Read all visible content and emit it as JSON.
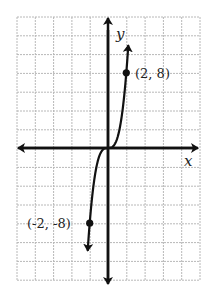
{
  "chart_data": {
    "type": "line",
    "title": "",
    "xlabel": "x",
    "ylabel": "y",
    "function": "y = x^3",
    "grid": true,
    "grid_scale": {
      "x_units_per_cell": 2,
      "y_units_per_cell": 2
    },
    "xlim": [
      -10,
      10
    ],
    "ylim": [
      -14,
      14
    ],
    "series": [
      {
        "name": "y = x^3",
        "x": [
          -2.2,
          -2,
          -1.5,
          -1,
          -0.5,
          0,
          0.5,
          1,
          1.5,
          2,
          2.2
        ],
        "y": [
          -10.65,
          -8,
          -3.375,
          -1,
          -0.125,
          0,
          0.125,
          1,
          3.375,
          8,
          10.65
        ]
      }
    ],
    "annotations": [
      {
        "text": "(2, 8)",
        "x": 2,
        "y": 8
      },
      {
        "text": "(-2, -8)",
        "x": -2,
        "y": -8
      }
    ],
    "colors": {
      "axis": "#111111",
      "grid": "#b8b8b8",
      "curve": "#111111"
    }
  },
  "labels": {
    "x_axis": "x",
    "y_axis": "y",
    "point_upper": "(2, 8)",
    "point_lower": "(-2, -8)"
  }
}
